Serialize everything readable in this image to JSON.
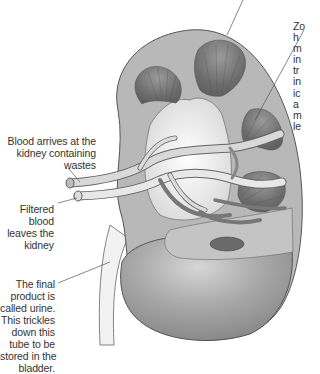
{
  "diagram": {
    "colors": {
      "cortex": "#b8b8b8",
      "pyramid": "#6e6e6e",
      "pelvis": "#eaeaea",
      "vessel": "#d9d9d9",
      "vessel_dark": "#8c8c8c",
      "outline": "#555555",
      "lower_body": "#9a9a9a",
      "leader_line": "#555555",
      "text": "#333333"
    },
    "labels": {
      "blood_in": {
        "lines": [
          "Blood arrives at the",
          "kidney containing",
          "wastes"
        ]
      },
      "blood_out": {
        "lines": [
          "Filtered",
          "blood",
          "leaves the",
          "kidney"
        ]
      },
      "urine": {
        "lines": [
          "The final",
          "product is",
          "called urine.",
          "This trickles",
          "down this",
          "tube to be",
          "stored in the",
          "bladder."
        ]
      },
      "zone_truncated": {
        "lines": [
          "Zo",
          "h",
          "m",
          "in",
          "tr",
          "in",
          "ic",
          "a",
          "m",
          "le"
        ]
      }
    }
  }
}
